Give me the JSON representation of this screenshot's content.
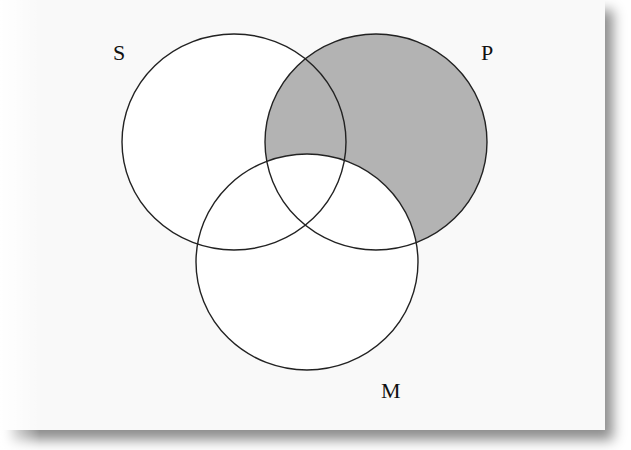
{
  "diagram": {
    "type": "venn",
    "sets": [
      {
        "id": "S",
        "label": "S",
        "cx": 234,
        "cy": 142,
        "rx": 112,
        "ry": 108,
        "label_x": 113,
        "label_y": 60
      },
      {
        "id": "P",
        "label": "P",
        "cx": 376,
        "cy": 142,
        "rx": 111,
        "ry": 108,
        "label_x": 481,
        "label_y": 60
      },
      {
        "id": "M",
        "label": "M",
        "cx": 307,
        "cy": 262,
        "rx": 111,
        "ry": 108,
        "label_x": 381,
        "label_y": 398
      }
    ],
    "shaded_region": "P minus M",
    "colors": {
      "shade": "#b3b3b3",
      "stroke": "#222222",
      "fill": "#ffffff",
      "card_background": "#f9f9f9"
    }
  }
}
